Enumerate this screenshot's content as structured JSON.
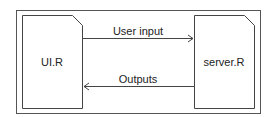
{
  "diagram": {
    "nodes": [
      {
        "id": "ui",
        "label": "UI.R"
      },
      {
        "id": "server",
        "label": "server.R"
      }
    ],
    "edges": [
      {
        "from": "ui",
        "to": "server",
        "label": "User input"
      },
      {
        "from": "server",
        "to": "ui",
        "label": "Outputs"
      }
    ]
  },
  "colors": {
    "stroke": "#444444",
    "text": "#222222",
    "background": "#ffffff"
  }
}
